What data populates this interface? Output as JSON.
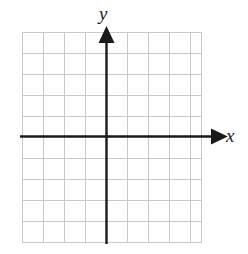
{
  "figure": {
    "kind": "cartesian-coordinate-grid",
    "title": "",
    "background_color": "#ffffff",
    "axis_color": "#1a1a1a",
    "grid_color": "#c9c9c9",
    "grid": {
      "left": 22,
      "top": 32,
      "right": 202,
      "bottom": 242,
      "cell_size": 21,
      "columns": 9,
      "rows": 10,
      "show_grid": true,
      "grid_style": "solid-light"
    },
    "axes": {
      "x": {
        "label": "x",
        "orientation": "horizontal",
        "y_pixel": 136,
        "start_x": 20,
        "end_x": 219,
        "arrow": "end",
        "line_width": 2.4
      },
      "y": {
        "label": "y",
        "orientation": "vertical",
        "x_pixel": 106,
        "start_y": 244,
        "end_y": 34,
        "arrow": "end",
        "line_width": 2.4
      }
    },
    "origin": {
      "x": 106,
      "y": 136
    },
    "tick_labels": [],
    "plotted_points": [],
    "plotted_curves": []
  }
}
